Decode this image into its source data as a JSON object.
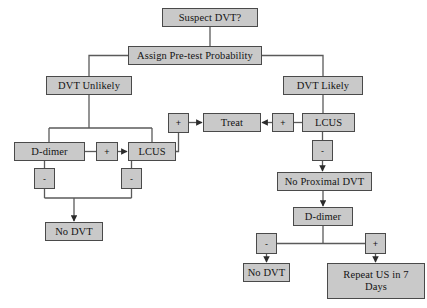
{
  "diagram": {
    "box_fill": "#c9c9c9",
    "box_border": "#4a4a4a",
    "line_color": "#555555",
    "background": "#ffffff",
    "nodes": [
      {
        "id": "suspect_dvt",
        "label": "Suspect DVT?",
        "x": 162,
        "y": 8,
        "w": 96,
        "h": 19
      },
      {
        "id": "assign_pretest",
        "label": "Assign Pre-test Probability",
        "x": 128,
        "y": 46,
        "w": 134,
        "h": 19
      },
      {
        "id": "dvt_unlikely",
        "label": "DVT Unlikely",
        "x": 46,
        "y": 76,
        "w": 86,
        "h": 19
      },
      {
        "id": "dvt_likely",
        "label": "DVT Likely",
        "x": 283,
        "y": 76,
        "w": 80,
        "h": 19
      },
      {
        "id": "treat",
        "label": "Treat",
        "x": 203,
        "y": 113,
        "w": 58,
        "h": 19
      },
      {
        "id": "lcus_right",
        "label": "LCUS",
        "x": 302,
        "y": 113,
        "w": 53,
        "h": 19
      },
      {
        "id": "d_dimer_left",
        "label": "D-dimer",
        "x": 14,
        "y": 142,
        "w": 71,
        "h": 19
      },
      {
        "id": "lcus_left",
        "label": "LCUS",
        "x": 128,
        "y": 142,
        "w": 48,
        "h": 19
      },
      {
        "id": "no_proximal_dvt",
        "label": "No Proximal DVT",
        "x": 277,
        "y": 172,
        "w": 95,
        "h": 19
      },
      {
        "id": "no_dvt_left",
        "label": "No DVT",
        "x": 45,
        "y": 222,
        "w": 58,
        "h": 19
      },
      {
        "id": "d_dimer_right",
        "label": "D-dimer",
        "x": 293,
        "y": 207,
        "w": 60,
        "h": 19
      },
      {
        "id": "no_dvt_right",
        "label": "No DVT",
        "x": 243,
        "y": 263,
        "w": 47,
        "h": 19
      },
      {
        "id": "repeat_us",
        "label": "Repeat US in 7\nDays",
        "x": 327,
        "y": 263,
        "w": 98,
        "h": 36
      }
    ],
    "signs": [
      {
        "id": "plus_unlikely_lcus",
        "label": "+",
        "x": 96,
        "y": 142,
        "w": 22,
        "h": 19
      },
      {
        "id": "plus_lcus_left_treat",
        "label": "+",
        "x": 168,
        "y": 113,
        "w": 21,
        "h": 20
      },
      {
        "id": "plus_lcus_right_treat",
        "label": "+",
        "x": 272,
        "y": 113,
        "w": 22,
        "h": 19
      },
      {
        "id": "minus_d_dimer_left",
        "label": "-",
        "x": 34,
        "y": 168,
        "w": 21,
        "h": 21
      },
      {
        "id": "minus_lcus_left",
        "label": "-",
        "x": 121,
        "y": 168,
        "w": 21,
        "h": 21
      },
      {
        "id": "minus_lcus_right",
        "label": "-",
        "x": 312,
        "y": 140,
        "w": 21,
        "h": 21
      },
      {
        "id": "minus_d_dimer_right",
        "label": "-",
        "x": 256,
        "y": 233,
        "w": 21,
        "h": 21
      },
      {
        "id": "plus_d_dimer_right",
        "label": "+",
        "x": 365,
        "y": 233,
        "w": 21,
        "h": 21
      }
    ],
    "edges": [
      {
        "id": "suspect-to-assign",
        "from": "suspect_dvt",
        "to": "assign_pretest"
      },
      {
        "id": "assign-to-unlikely",
        "from": "assign_pretest",
        "to": "dvt_unlikely"
      },
      {
        "id": "assign-to-likely",
        "from": "assign_pretest",
        "to": "dvt_likely"
      },
      {
        "id": "unlikely-to-ddimer",
        "from": "dvt_unlikely",
        "to": "d_dimer_left"
      },
      {
        "id": "unlikely-to-lcus",
        "from": "dvt_unlikely",
        "to": "lcus_left"
      },
      {
        "id": "ddimer-plus-to-lcus",
        "from": "d_dimer_left",
        "to": "lcus_left",
        "sign": "+"
      },
      {
        "id": "lcus-left-plus-to-treat",
        "from": "lcus_left",
        "to": "treat",
        "sign": "+"
      },
      {
        "id": "lcus-right-plus-to-treat",
        "from": "lcus_right",
        "to": "treat",
        "sign": "+"
      },
      {
        "id": "likely-to-lcus-right",
        "from": "dvt_likely",
        "to": "lcus_right"
      },
      {
        "id": "ddimer-minus-to-nodvt",
        "from": "d_dimer_left",
        "to": "no_dvt_left",
        "sign": "-"
      },
      {
        "id": "lcus-left-minus-to-nodvt",
        "from": "lcus_left",
        "to": "no_dvt_left",
        "sign": "-"
      },
      {
        "id": "lcus-right-minus-to-noprox",
        "from": "lcus_right",
        "to": "no_proximal_dvt",
        "sign": "-"
      },
      {
        "id": "noprox-to-ddimer",
        "from": "no_proximal_dvt",
        "to": "d_dimer_right"
      },
      {
        "id": "ddimer-minus-to-nodvt-r",
        "from": "d_dimer_right",
        "to": "no_dvt_right",
        "sign": "-"
      },
      {
        "id": "ddimer-plus-to-repeat",
        "from": "d_dimer_right",
        "to": "repeat_us",
        "sign": "+"
      }
    ]
  }
}
